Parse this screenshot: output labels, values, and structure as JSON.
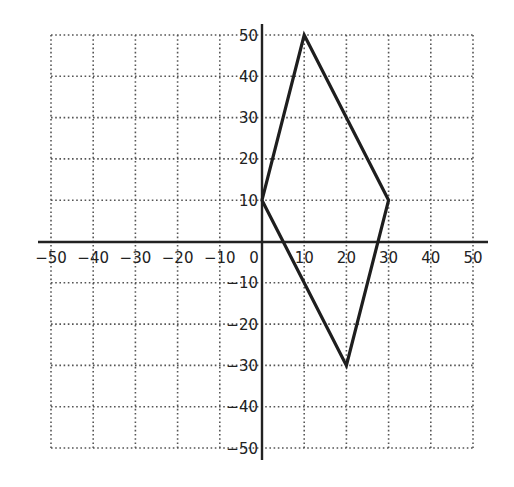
{
  "diagram": {
    "type": "coordinate-plane",
    "x_range": [
      -50,
      50
    ],
    "y_range": [
      -50,
      50
    ],
    "grid_step": 10,
    "x_tick_labels": [
      "-50",
      "-40",
      "-30",
      "-20",
      "-10",
      "0",
      "10",
      "20",
      "30",
      "40",
      "50"
    ],
    "y_tick_labels": [
      "50",
      "40",
      "30",
      "20",
      "10",
      "-10",
      "-20",
      "-30",
      "-40",
      "-50"
    ],
    "origin_label": "0",
    "grid_style": "dotted",
    "colors": {
      "axis": "#222222",
      "grid": "#555555",
      "shape": "#1e1e1e"
    },
    "shape": {
      "type": "quadrilateral",
      "vertices": [
        [
          0,
          10
        ],
        [
          10,
          50
        ],
        [
          30,
          10
        ],
        [
          20,
          -30
        ]
      ]
    }
  },
  "chart_data": {
    "type": "scatter",
    "title": "",
    "xlabel": "",
    "ylabel": "",
    "xlim": [
      -50,
      50
    ],
    "ylim": [
      -50,
      50
    ],
    "grid": true,
    "x_ticks": [
      -50,
      -40,
      -30,
      -20,
      -10,
      0,
      10,
      20,
      30,
      40,
      50
    ],
    "y_ticks": [
      -50,
      -40,
      -30,
      -20,
      -10,
      10,
      20,
      30,
      40,
      50
    ],
    "series": [
      {
        "name": "quadrilateral",
        "closed": true,
        "x": [
          0,
          10,
          30,
          20
        ],
        "y": [
          10,
          50,
          10,
          -30
        ]
      }
    ]
  }
}
